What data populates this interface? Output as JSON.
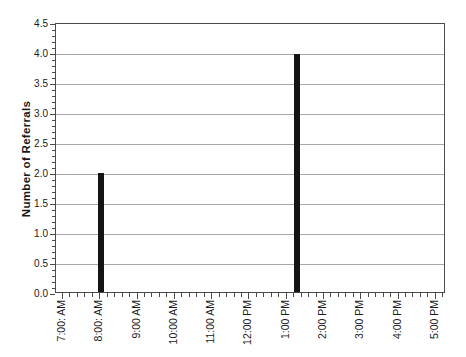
{
  "chart_data": {
    "type": "bar",
    "title": "",
    "xlabel": "",
    "ylabel": "Number of Referrals",
    "x_tick_labels": [
      "7:00: AM",
      "8:00: AM",
      "9:00 AM",
      "10:00 AM",
      "11:00 AM",
      "12:00 PM",
      "1:00 PM",
      "2:00 PM",
      "3:00 PM",
      "4:00 PM",
      "5:00 PM"
    ],
    "x_tick_hours": [
      7,
      8,
      9,
      10,
      11,
      12,
      13,
      14,
      15,
      16,
      17
    ],
    "x_axis_range_hours": [
      6.84,
      17.3
    ],
    "x_minor_tick_interval_hours": 0.2,
    "y_tick_labels": [
      "0.0",
      "0.5",
      "1.0",
      "1.5",
      "2.0",
      "2.5",
      "3.0",
      "3.5",
      "4.0",
      "4.5"
    ],
    "y_ticks": [
      0,
      0.5,
      1,
      1.5,
      2,
      2.5,
      3,
      3.5,
      4,
      4.5
    ],
    "ylim": [
      0,
      4.5
    ],
    "y_minor_tick_interval": 0.1,
    "grid": "horizontal-major-only",
    "legend": "none",
    "series": [
      {
        "name": "Referrals",
        "points": [
          {
            "x_hour": 8.05,
            "x_approx_label": "8:00 AM",
            "value": 2.0
          },
          {
            "x_hour": 13.35,
            "x_approx_label": "1:20 PM",
            "value": 4.0
          }
        ]
      }
    ],
    "colors": {
      "bar": "#141414",
      "gridline": "#a8a8a8",
      "frame": "#4a4a4a",
      "text": "#1a1a1a",
      "background": "#ffffff"
    }
  }
}
